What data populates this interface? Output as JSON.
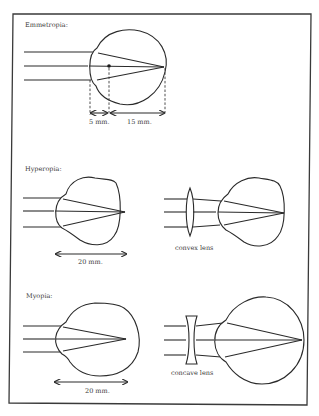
{
  "figure": {
    "colors": {
      "ink": "#2a2a2a",
      "background": "#ffffff"
    },
    "panels": [
      {
        "id": "emmetropia",
        "title": "Emmetropia:",
        "dimensions": [
          {
            "label": "5 mm."
          },
          {
            "label": "15 mm."
          }
        ]
      },
      {
        "id": "hyperopia",
        "title": "Hyperopia:",
        "dimension": {
          "label": "20 mm."
        },
        "correction": {
          "lens_label": "convex lens"
        }
      },
      {
        "id": "myopia",
        "title": "Myopia:",
        "dimension": {
          "label": "20 mm."
        },
        "correction": {
          "lens_label": "concave lens"
        }
      }
    ]
  }
}
